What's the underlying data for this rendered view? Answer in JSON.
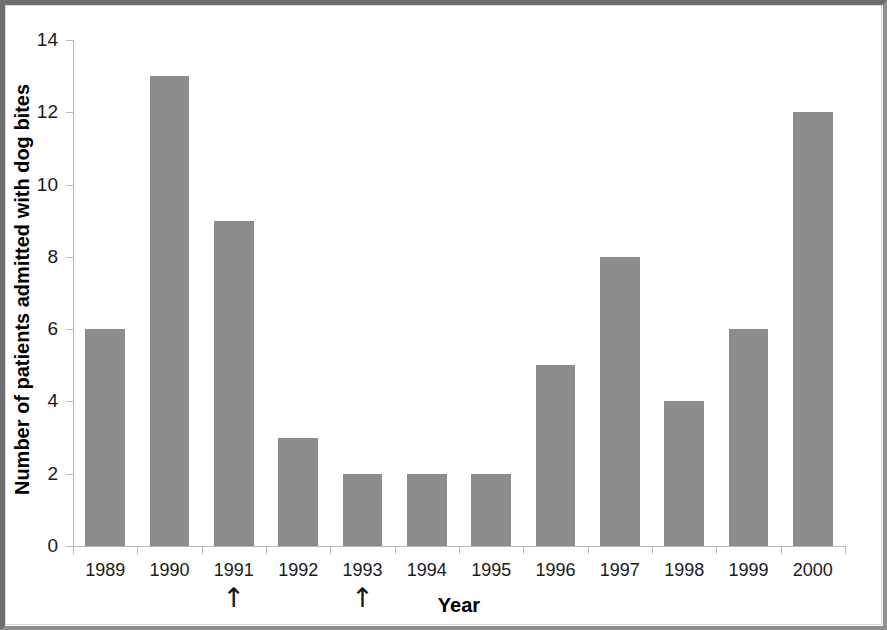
{
  "chart_data": {
    "type": "bar",
    "title": "",
    "xlabel": "Year",
    "ylabel": "Number of patients admitted with dog bites",
    "categories": [
      "1989",
      "1990",
      "1991",
      "1992",
      "1993",
      "1994",
      "1995",
      "1996",
      "1997",
      "1998",
      "1999",
      "2000"
    ],
    "values": [
      6,
      13,
      9,
      3,
      2,
      2,
      2,
      5,
      8,
      4,
      6,
      12
    ],
    "ylim": [
      0,
      14
    ],
    "ytick_labels": [
      "0",
      "2",
      "4",
      "6",
      "8",
      "10",
      "12",
      "14"
    ],
    "ytick_values": [
      0,
      2,
      4,
      6,
      8,
      10,
      12,
      14
    ],
    "grid": false,
    "legend": null,
    "bar_color": "#8c8c8c",
    "background_color": "#ffffff",
    "axis_color": "#b9b9b9",
    "text_color": "#1a1a1a",
    "annotations": [
      {
        "category": "1991",
        "marker": "up-arrow",
        "glyph": "↑"
      },
      {
        "category": "1993",
        "marker": "up-arrow",
        "glyph": "↑"
      }
    ]
  }
}
